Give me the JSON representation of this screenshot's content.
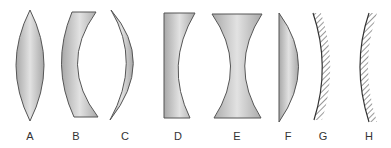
{
  "figure": {
    "items": [
      {
        "id": "A",
        "label": "A",
        "type": "biconvex-lens",
        "x": 30
      },
      {
        "id": "B",
        "label": "B",
        "type": "concave-meniscus-lens",
        "x": 75
      },
      {
        "id": "C",
        "label": "C",
        "type": "convex-meniscus-lens",
        "x": 124
      },
      {
        "id": "D",
        "label": "D",
        "type": "plano-concave-lens",
        "x": 177
      },
      {
        "id": "E",
        "label": "E",
        "type": "biconcave-lens",
        "x": 237
      },
      {
        "id": "F",
        "label": "F",
        "type": "plano-convex-lens",
        "x": 287
      },
      {
        "id": "G",
        "label": "G",
        "type": "concave-mirror",
        "x": 322
      },
      {
        "id": "H",
        "label": "H",
        "type": "convex-mirror",
        "x": 368
      }
    ]
  },
  "colors": {
    "lens_fill": "#b8b8b8",
    "lens_highlight": "#e6e6e6",
    "outline": "#555555",
    "label": "#333333"
  }
}
